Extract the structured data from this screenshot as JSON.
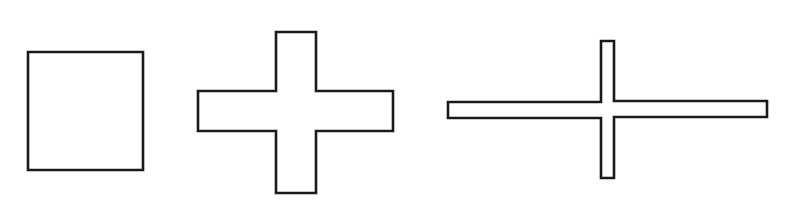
{
  "canvas": {
    "width": 799,
    "height": 205,
    "background": "#ffffff",
    "stroke": "#1a1a1a"
  },
  "shapes": [
    {
      "name": "square",
      "points": "28,52 143,52 143,170 28,170"
    },
    {
      "name": "thick-cross",
      "points": "276,32 316,32 316,91 393,91 393,131 316,131 316,193 276,193 276,131 198,131 198,91 276,91"
    },
    {
      "name": "thin-cross",
      "points": "601,41 614,41 614,101 767,101 767,117 614,117 614,178 601,178 601,118 448,118 448,102 601,102"
    }
  ]
}
